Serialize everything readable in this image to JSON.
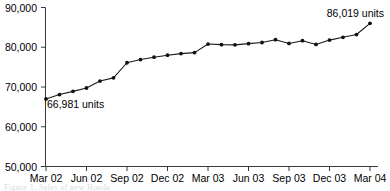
{
  "chart_data": {
    "type": "line",
    "title": "",
    "subtitle": "",
    "xlabel": "",
    "ylabel": "",
    "ylim": [
      50000,
      90000
    ],
    "ytick_values": [
      50000,
      60000,
      70000,
      80000,
      90000
    ],
    "ytick_labels": [
      "50,000",
      "60,000",
      "70,000",
      "80,000",
      "90,000"
    ],
    "xtick_labels": [
      "Mar 02",
      "Jun 02",
      "Sep 02",
      "Dec 02",
      "Mar 03",
      "Jun 03",
      "Sep 03",
      "Dec 03",
      "Mar 04"
    ],
    "grid": false,
    "legend": false,
    "legend_position": "none",
    "x": [
      "Mar 02",
      "Apr 02",
      "May 02",
      "Jun 02",
      "Jul 02",
      "Aug 02",
      "Sep 02",
      "Oct 02",
      "Nov 02",
      "Dec 02",
      "Jan 03",
      "Feb 03",
      "Mar 03",
      "Apr 03",
      "May 03",
      "Jun 03",
      "Jul 03",
      "Aug 03",
      "Sep 03",
      "Oct 03",
      "Nov 03",
      "Dec 03",
      "Jan 04",
      "Feb 04",
      "Mar 04"
    ],
    "values": [
      66981,
      68100,
      68900,
      69750,
      71500,
      72300,
      76100,
      76900,
      77500,
      78000,
      78400,
      78650,
      80800,
      80650,
      80600,
      80900,
      81200,
      81900,
      80950,
      81650,
      80700,
      81800,
      82500,
      83200,
      86019
    ],
    "series": [
      {
        "name": "units",
        "values": [
          66981,
          68100,
          68900,
          69750,
          71500,
          72300,
          76100,
          76900,
          77500,
          78000,
          78400,
          78650,
          80800,
          80650,
          80600,
          80900,
          81200,
          81900,
          80950,
          81650,
          80700,
          81800,
          82500,
          83200,
          86019
        ]
      }
    ],
    "annotations": [
      {
        "text": "66,981 units",
        "value": 66981,
        "point_index": 0,
        "position": "below-right"
      },
      {
        "text": "86,019 units",
        "value": 86019,
        "point_index": 24,
        "position": "above-left"
      }
    ],
    "marker_color": "#111111",
    "line_color": "#1a1a1a",
    "axis_color": "#3a3a3a"
  },
  "figure": {
    "caption": "Figure 1. Sales of new Honda"
  }
}
